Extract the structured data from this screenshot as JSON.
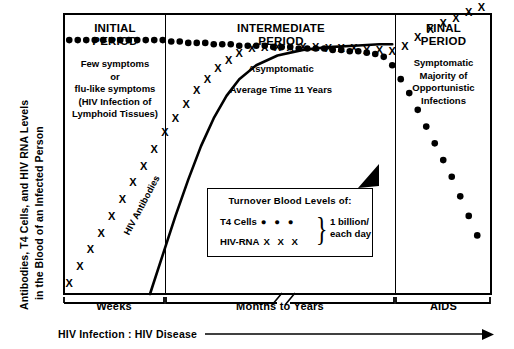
{
  "axes": {
    "ylabel_line1": "Antibodies, T4 Cells, and HIV RNA Levels",
    "ylabel_line2": "in the Blood of an Infected Person",
    "xticks": [
      "Weeks",
      "Months to Years",
      "AIDS"
    ],
    "progression_label": "HIV Infection : HIV Disease"
  },
  "periods": [
    {
      "title_line1": "INITIAL",
      "title_line2": "PERIOD",
      "body": [
        "Few symptoms",
        "or",
        "flu-like symptoms",
        "(HIV Infection of",
        "Lymphoid Tissues)"
      ]
    },
    {
      "title_line1": "INTERMEDIATE",
      "title_line2": "PERIOD",
      "body": [
        "Asymptomatic",
        "",
        "Average Time 11 Years"
      ]
    },
    {
      "title_line1": "FINAL",
      "title_line2": "PERIOD",
      "body": [
        "Symptomatic",
        "Majority of",
        "Opportunistic",
        "Infections"
      ]
    }
  ],
  "curve_label": "HIV Antibodies",
  "legend": {
    "title": "Turnover  Blood Levels of:",
    "rows": [
      {
        "key": "T4 Cells",
        "marks": "● ● ●"
      },
      {
        "key": "HIV-RNA",
        "marks": "X X X"
      }
    ],
    "brace": "}",
    "rate_line1": "1 billion/",
    "rate_line2": "each day"
  },
  "chart_data": {
    "type": "line",
    "title": "Antibodies, T4 Cells, and HIV RNA Levels in the Blood of an Infected Person",
    "xlabel": "HIV Infection : HIV Disease",
    "ylabel": "Antibodies, T4 Cells, and HIV RNA Levels in the Blood of an Infected Person",
    "xlim": [
      0,
      100
    ],
    "ylim": [
      0,
      100
    ],
    "grid": false,
    "legend_position": "center",
    "xtick_labels": [
      "Weeks",
      "Months to Years",
      "AIDS"
    ],
    "phase_boundaries": [
      23.8,
      77.4
    ],
    "series": [
      {
        "name": "T4 Cells",
        "marker": "filled-circle",
        "x": [
          1,
          3,
          5,
          7,
          9,
          11,
          13,
          15,
          17,
          19,
          21,
          23,
          25,
          27,
          29,
          31,
          33,
          35,
          37,
          39,
          41,
          43,
          45,
          47,
          49,
          51,
          53,
          55,
          57,
          59,
          61,
          63,
          65,
          67,
          69,
          71,
          73,
          75,
          77,
          79,
          81,
          83,
          85,
          87,
          89,
          91,
          93,
          95,
          97
        ],
        "y": [
          91,
          91,
          91,
          91,
          91,
          91,
          91,
          91,
          91,
          91,
          91,
          91,
          90.5,
          90.5,
          90,
          90,
          90,
          89.5,
          89.5,
          89.5,
          89,
          89,
          89,
          89,
          88.5,
          88.5,
          88.5,
          88,
          88,
          88,
          88,
          87.5,
          87.5,
          87,
          87,
          86.5,
          86,
          85,
          82,
          77,
          72,
          66,
          60,
          54,
          48,
          42,
          35,
          28,
          21
        ]
      },
      {
        "name": "HIV-RNA",
        "marker": "x",
        "x": [
          1,
          3.5,
          6,
          8.5,
          11,
          13.5,
          16,
          18.5,
          21,
          23.5,
          26,
          28.5,
          31,
          33.5,
          36,
          38.5,
          41,
          44,
          47,
          50,
          53,
          56,
          59,
          62,
          65,
          68,
          71,
          74,
          77,
          80,
          83,
          86,
          89,
          92,
          95,
          98
        ],
        "y": [
          4,
          10,
          16,
          22,
          28,
          34,
          40,
          46,
          52,
          58,
          63,
          68,
          73,
          77,
          81,
          84,
          86.5,
          88,
          88.5,
          88.5,
          88.5,
          88.5,
          88.5,
          88,
          88,
          88,
          87.5,
          87.5,
          87,
          89,
          92,
          95,
          97,
          99,
          101,
          103
        ]
      },
      {
        "name": "HIV Antibodies",
        "marker": "line",
        "x": [
          20,
          23,
          26,
          29,
          32,
          35,
          38,
          41,
          45,
          50,
          56,
          62,
          68,
          74,
          77
        ],
        "y": [
          0,
          14,
          28,
          41,
          53,
          63,
          71,
          77,
          82,
          85.5,
          87.5,
          88.5,
          89,
          89.5,
          89.5
        ]
      }
    ],
    "annotations": [
      {
        "text": "HIV Antibodies",
        "type": "curve-label"
      },
      {
        "text": "arrow pointing to antibody/T4 junction",
        "type": "arrowhead"
      },
      {
        "text": "axis break in Months to Years bracket",
        "type": "axis-break"
      }
    ]
  }
}
